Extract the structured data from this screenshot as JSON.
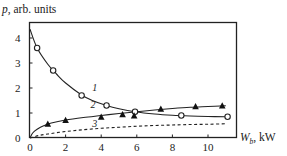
{
  "chart_data": {
    "type": "line",
    "title": "",
    "xlabel": "W_b, kW",
    "xlabel_main": "W",
    "xlabel_sub": "b",
    "xlabel_unit": ", kW",
    "ylabel": "p, arb. units",
    "ylabel_var": "p",
    "ylabel_unit": ", arb. units",
    "xlim": [
      0,
      11.5
    ],
    "ylim": [
      0,
      4.6
    ],
    "xticks": [
      0,
      2,
      4,
      6,
      8,
      10
    ],
    "yticks": [
      0,
      1,
      2,
      3,
      4
    ],
    "grid": false,
    "legend": "none (inline curve labels 1, 2, 3)",
    "series": [
      {
        "name": "1",
        "marker": "open-circle",
        "line": "solid",
        "points": [
          [
            0.4,
            3.6
          ],
          [
            1.3,
            2.7
          ],
          [
            2.9,
            1.7
          ],
          [
            4.3,
            1.3
          ],
          [
            5.9,
            1.05
          ],
          [
            8.5,
            0.9
          ],
          [
            11.1,
            0.85
          ]
        ],
        "fit": [
          [
            0,
            4.35
          ],
          [
            0.4,
            3.6
          ],
          [
            1.0,
            2.95
          ],
          [
            1.5,
            2.55
          ],
          [
            2.0,
            2.2
          ],
          [
            2.9,
            1.72
          ],
          [
            3.5,
            1.5
          ],
          [
            4.3,
            1.3
          ],
          [
            5.0,
            1.17
          ],
          [
            5.9,
            1.05
          ],
          [
            7.0,
            0.96
          ],
          [
            8.0,
            0.91
          ],
          [
            9.0,
            0.88
          ],
          [
            10.0,
            0.86
          ],
          [
            11.0,
            0.85
          ]
        ],
        "label_pos": [
          3.5,
          1.9
        ]
      },
      {
        "name": "2",
        "marker": "filled-triangle",
        "line": "solid",
        "points": [
          [
            1.0,
            0.55
          ],
          [
            2.0,
            0.7
          ],
          [
            4.0,
            0.83
          ],
          [
            5.2,
            0.93
          ],
          [
            5.85,
            0.88
          ],
          [
            7.35,
            1.15
          ],
          [
            9.3,
            1.25
          ],
          [
            10.8,
            1.28
          ]
        ],
        "fit": [
          [
            0,
            0
          ],
          [
            0.15,
            0.2
          ],
          [
            0.4,
            0.35
          ],
          [
            0.8,
            0.5
          ],
          [
            1.2,
            0.6
          ],
          [
            2.0,
            0.72
          ],
          [
            3.0,
            0.82
          ],
          [
            4.0,
            0.9
          ],
          [
            5.0,
            0.98
          ],
          [
            6.0,
            1.05
          ],
          [
            7.0,
            1.12
          ],
          [
            8.0,
            1.18
          ],
          [
            9.0,
            1.23
          ],
          [
            10.0,
            1.26
          ],
          [
            11.0,
            1.29
          ]
        ],
        "label_pos": [
          3.4,
          1.2
        ]
      },
      {
        "name": "3",
        "marker": "none",
        "line": "dashed",
        "points": [],
        "fit": [
          [
            0,
            0
          ],
          [
            0.5,
            0.1
          ],
          [
            1.0,
            0.16
          ],
          [
            2.0,
            0.26
          ],
          [
            3.0,
            0.33
          ],
          [
            4.0,
            0.39
          ],
          [
            5.0,
            0.43
          ],
          [
            6.0,
            0.47
          ],
          [
            7.0,
            0.5
          ],
          [
            8.0,
            0.52
          ],
          [
            9.0,
            0.54
          ],
          [
            10.0,
            0.55
          ],
          [
            11.0,
            0.57
          ]
        ],
        "label_pos": [
          3.5,
          0.45
        ]
      }
    ]
  }
}
